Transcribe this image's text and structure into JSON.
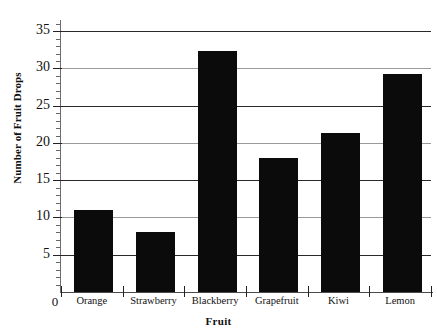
{
  "chart_data": {
    "type": "bar",
    "title": "",
    "subtitle": "",
    "xlabel": "Fruit",
    "ylabel": "Number of Fruit Drops",
    "categories": [
      "Orange",
      "Strawberry",
      "Blackberry",
      "Grapefruit",
      "Kiwi",
      "Lemon"
    ],
    "values": [
      11,
      8,
      32.3,
      18,
      21.4,
      29.3
    ],
    "ylim": [
      0,
      36.5
    ],
    "ytick_labels": [
      "5",
      "10",
      "15",
      "20",
      "25",
      "30",
      "35"
    ],
    "ytick_values": [
      5,
      10,
      15,
      20,
      25,
      30,
      35
    ],
    "ytick_minor_step": 1,
    "origin_label": "0",
    "grid": "horizontal",
    "legend": "none",
    "bar_color": "#0b0b0b",
    "background_color": "#ffffff",
    "axis_color": "#222222"
  }
}
